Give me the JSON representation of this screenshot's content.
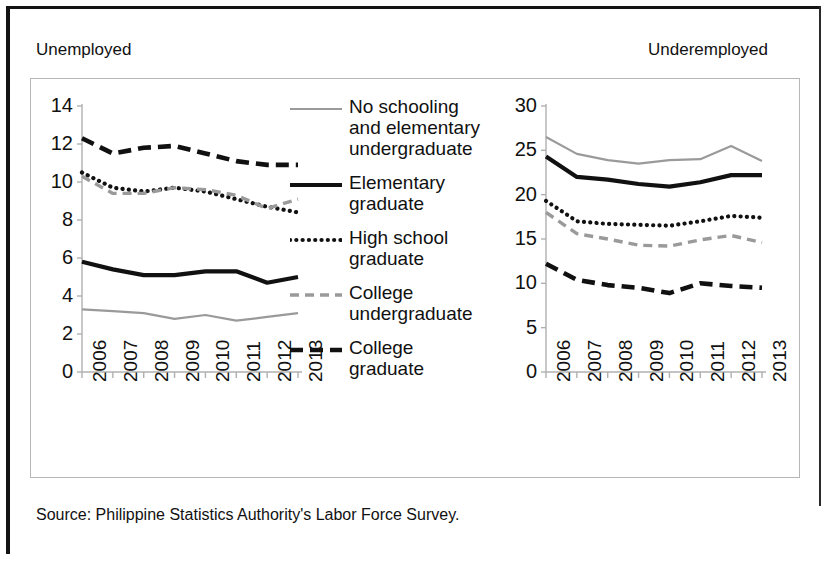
{
  "figure": {
    "caption_left": "Unemployed",
    "caption_right": "Underemployed",
    "source": "Source:  Philippine Statistics Authority's Labor Force Survey."
  },
  "legend": {
    "items": [
      {
        "label": "No schooling and elementary undergraduate",
        "style": "solid-thin",
        "color": "#9a9a9a",
        "icon": "legend-line-no-schooling"
      },
      {
        "label": "Elementary graduate",
        "style": "solid-thick",
        "color": "#111111",
        "icon": "legend-line-elementary-graduate"
      },
      {
        "label": "High school graduate",
        "style": "dotted",
        "color": "#111111",
        "icon": "legend-line-high-school-graduate"
      },
      {
        "label": "College undergraduate",
        "style": "dashed",
        "color": "#9a9a9a",
        "icon": "legend-line-college-undergraduate"
      },
      {
        "label": "College graduate",
        "style": "dashed-thick",
        "color": "#111111",
        "icon": "legend-line-college-graduate"
      }
    ]
  },
  "chart_data": [
    {
      "id": "unemployed",
      "type": "line",
      "title": "Unemployed",
      "xlabel": "",
      "ylabel": "",
      "categories": [
        "2006",
        "2007",
        "2008",
        "2009",
        "2010",
        "2011",
        "2012",
        "2013"
      ],
      "x": [
        2006,
        2007,
        2008,
        2009,
        2010,
        2011,
        2012,
        2013
      ],
      "ylim": [
        0,
        14
      ],
      "yticks": [
        0,
        2,
        4,
        6,
        8,
        10,
        12,
        14
      ],
      "grid": false,
      "legend_position": "center",
      "series": [
        {
          "name": "No schooling and elementary undergraduate",
          "color": "#9a9a9a",
          "style": "solid-thin",
          "values": [
            3.3,
            3.2,
            3.1,
            2.8,
            3.0,
            2.7,
            2.9,
            3.1
          ]
        },
        {
          "name": "Elementary graduate",
          "color": "#111111",
          "style": "solid-thick",
          "values": [
            5.8,
            5.4,
            5.1,
            5.1,
            5.3,
            5.3,
            4.7,
            5.0
          ]
        },
        {
          "name": "High school graduate",
          "color": "#111111",
          "style": "dotted",
          "values": [
            10.5,
            9.7,
            9.5,
            9.7,
            9.5,
            9.1,
            8.7,
            8.4
          ]
        },
        {
          "name": "College undergraduate",
          "color": "#9a9a9a",
          "style": "dashed",
          "values": [
            10.3,
            9.4,
            9.4,
            9.7,
            9.6,
            9.3,
            8.6,
            9.1
          ]
        },
        {
          "name": "College graduate",
          "color": "#111111",
          "style": "dashed-thick",
          "values": [
            12.3,
            11.5,
            11.8,
            11.9,
            11.5,
            11.1,
            10.9,
            10.9
          ]
        }
      ]
    },
    {
      "id": "underemployed",
      "type": "line",
      "title": "Underemployed",
      "xlabel": "",
      "ylabel": "",
      "categories": [
        "2006",
        "2007",
        "2008",
        "2009",
        "2010",
        "2011",
        "2012",
        "2013"
      ],
      "x": [
        2006,
        2007,
        2008,
        2009,
        2010,
        2011,
        2012,
        2013
      ],
      "ylim": [
        0,
        30
      ],
      "yticks": [
        0,
        5,
        10,
        15,
        20,
        25,
        30
      ],
      "grid": false,
      "legend_position": "center",
      "series": [
        {
          "name": "No schooling and elementary undergraduate",
          "color": "#9a9a9a",
          "style": "solid-thin",
          "values": [
            26.5,
            24.6,
            23.9,
            23.5,
            23.9,
            24.0,
            25.5,
            23.8
          ]
        },
        {
          "name": "Elementary graduate",
          "color": "#111111",
          "style": "solid-thick",
          "values": [
            24.3,
            22.0,
            21.7,
            21.2,
            20.9,
            21.4,
            22.2,
            22.2
          ]
        },
        {
          "name": "High school graduate",
          "color": "#111111",
          "style": "dotted",
          "values": [
            19.3,
            17.0,
            16.7,
            16.6,
            16.5,
            17.0,
            17.6,
            17.4
          ]
        },
        {
          "name": "College undergraduate",
          "color": "#9a9a9a",
          "style": "dashed",
          "values": [
            18.0,
            15.6,
            15.0,
            14.3,
            14.2,
            14.9,
            15.4,
            14.6
          ]
        },
        {
          "name": "College graduate",
          "color": "#111111",
          "style": "dashed-thick",
          "values": [
            12.2,
            10.4,
            9.8,
            9.5,
            8.9,
            10.0,
            9.7,
            9.5
          ]
        }
      ]
    }
  ]
}
